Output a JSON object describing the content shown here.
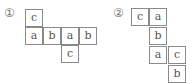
{
  "diagrams": [
    {
      "label": "①",
      "label_pos": [
        4,
        7
      ],
      "cells": [
        {
          "text": "c",
          "x": 25,
          "y": 9
        },
        {
          "text": "a",
          "x": 25,
          "y": 27
        },
        {
          "text": "b",
          "x": 43,
          "y": 27
        },
        {
          "text": "a",
          "x": 61,
          "y": 27
        },
        {
          "text": "b",
          "x": 79,
          "y": 27
        },
        {
          "text": "c",
          "x": 61,
          "y": 45
        }
      ]
    },
    {
      "label": "②",
      "label_pos": [
        113,
        7
      ],
      "cells": [
        {
          "text": "c",
          "x": 131,
          "y": 8
        },
        {
          "text": "a",
          "x": 149,
          "y": 8
        },
        {
          "text": "b",
          "x": 149,
          "y": 27
        },
        {
          "text": "a",
          "x": 149,
          "y": 46
        },
        {
          "text": "c",
          "x": 168,
          "y": 46
        },
        {
          "text": "b",
          "x": 168,
          "y": 65
        }
      ]
    }
  ]
}
